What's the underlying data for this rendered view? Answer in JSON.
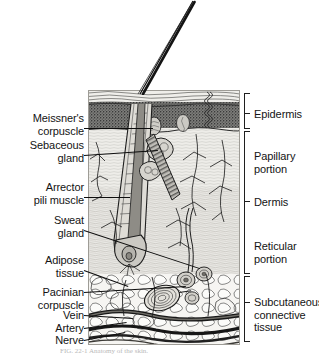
{
  "figure": {
    "caption_partial": "FIG. 22-1  Anatomy of the skin."
  },
  "labels_left": [
    {
      "id": "meissners-corpuscle",
      "text_lines": [
        "Meissner's",
        "corpuscle"
      ],
      "x": 6,
      "y": 112,
      "width": 78,
      "leader": {
        "x1": 84,
        "y1": 128,
        "x2": 153,
        "y2": 128
      }
    },
    {
      "id": "sebaceous-gland",
      "text_lines": [
        "Sebaceous",
        "gland"
      ],
      "x": 6,
      "y": 139,
      "width": 78,
      "leader": {
        "x1": 84,
        "y1": 155,
        "x2": 158,
        "y2": 150
      }
    },
    {
      "id": "arrector-pili-muscle",
      "text_lines": [
        "Arrector",
        "pili muscle"
      ],
      "x": 6,
      "y": 181,
      "width": 78,
      "leader": {
        "x1": 84,
        "y1": 197,
        "x2": 130,
        "y2": 197
      }
    },
    {
      "id": "sweat-gland",
      "text_lines": [
        "Sweat",
        "gland"
      ],
      "x": 6,
      "y": 214,
      "width": 78,
      "leader": {
        "x1": 84,
        "y1": 230,
        "x2": 200,
        "y2": 268
      }
    },
    {
      "id": "adipose-tissue",
      "text_lines": [
        "Adipose",
        "tissue"
      ],
      "x": 6,
      "y": 254,
      "width": 78,
      "leader": {
        "x1": 84,
        "y1": 270,
        "x2": 128,
        "y2": 286
      }
    },
    {
      "id": "pacinian-corpuscle",
      "text_lines": [
        "Pacinian",
        "corpuscle"
      ],
      "x": 6,
      "y": 286,
      "width": 78,
      "leader": {
        "x1": 84,
        "y1": 292,
        "x2": 186,
        "y2": 286
      }
    },
    {
      "id": "vein",
      "text_lines": [
        "Vein"
      ],
      "x": 6,
      "y": 309,
      "width": 78,
      "leader": {
        "x1": 84,
        "y1": 315,
        "x2": 133,
        "y2": 318
      }
    },
    {
      "id": "artery",
      "text_lines": [
        "Artery"
      ],
      "x": 6,
      "y": 322,
      "width": 78,
      "leader": {
        "x1": 84,
        "y1": 328,
        "x2": 126,
        "y2": 322
      }
    },
    {
      "id": "nerve",
      "text_lines": [
        "Nerve"
      ],
      "x": 6,
      "y": 334,
      "width": 78,
      "leader": {
        "x1": 84,
        "y1": 340,
        "x2": 124,
        "y2": 332
      }
    }
  ],
  "labels_right": [
    {
      "id": "epidermis",
      "text_lines": [
        "Epidermis"
      ],
      "x": 254,
      "y": 108
    },
    {
      "id": "papillary-portion",
      "text_lines": [
        "Papillary",
        "portion"
      ],
      "x": 254,
      "y": 150
    },
    {
      "id": "dermis",
      "text_lines": [
        "Dermis"
      ],
      "x": 254,
      "y": 196
    },
    {
      "id": "reticular-portion",
      "text_lines": [
        "Reticular",
        "portion"
      ],
      "x": 254,
      "y": 240
    },
    {
      "id": "subcutaneous-connective-tissue",
      "text_lines": [
        "Subcutaneous",
        "connective",
        "tissue"
      ],
      "x": 254,
      "y": 296
    }
  ],
  "brackets": [
    {
      "id": "bracket-epidermis",
      "x": 244,
      "y": 93,
      "height": 36,
      "label": "Epidermis"
    },
    {
      "id": "bracket-dermis",
      "x": 244,
      "y": 131,
      "height": 143,
      "label": "Dermis"
    },
    {
      "id": "bracket-subcutaneous",
      "x": 244,
      "y": 276,
      "height": 66,
      "label": "Subcutaneous connective tissue"
    }
  ],
  "ticks": [
    {
      "id": "tick-epidermis",
      "x": 244,
      "y": 113
    },
    {
      "id": "tick-dermis",
      "x": 244,
      "y": 201
    },
    {
      "id": "tick-subcut",
      "x": 244,
      "y": 302
    }
  ],
  "structures": [
    {
      "id": "hair-shaft",
      "name": "hair shaft"
    },
    {
      "id": "stratum-corneum",
      "name": "stratum corneum"
    },
    {
      "id": "epidermis-layer",
      "name": "epidermis stippled layer"
    },
    {
      "id": "hair-follicle",
      "name": "hair follicle"
    },
    {
      "id": "hair-bulb",
      "name": "hair bulb"
    },
    {
      "id": "sebaceous-gland",
      "name": "sebaceous gland"
    },
    {
      "id": "arrector-pili",
      "name": "arrector pili muscle"
    },
    {
      "id": "sweat-gland-coil",
      "name": "sweat gland coil"
    },
    {
      "id": "sweat-duct",
      "name": "sweat duct"
    },
    {
      "id": "pacinian",
      "name": "pacinian corpuscle"
    },
    {
      "id": "meissner",
      "name": "meissner corpuscle"
    },
    {
      "id": "adipose",
      "name": "adipose tissue lobules"
    },
    {
      "id": "vein",
      "name": "vein"
    },
    {
      "id": "artery",
      "name": "artery"
    },
    {
      "id": "nerve",
      "name": "nerve"
    },
    {
      "id": "capillary-network",
      "name": "capillary network"
    }
  ],
  "colors": {
    "ink": "#141414",
    "bracket": "#1f1f1f",
    "background": "#ffffff",
    "dermis_fill": "#e9e8e4",
    "epidermis_fill": "#8d8d8a",
    "subcut_fill": "#f2f1ee",
    "vessel": "#4a4a4a",
    "caption": "#b9b9b9"
  }
}
